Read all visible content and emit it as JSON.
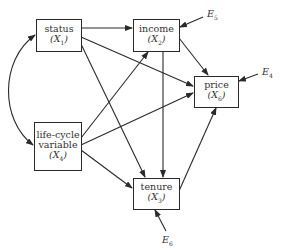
{
  "diagram": {
    "type": "path-diagram",
    "nodes": [
      {
        "id": "status",
        "label": "status",
        "var": "X",
        "sub": "1"
      },
      {
        "id": "income",
        "label": "income",
        "var": "X",
        "sub": "2"
      },
      {
        "id": "price",
        "label": "price",
        "var": "X",
        "sub": "6"
      },
      {
        "id": "lifecycle",
        "label": "life-cycle variable",
        "label_line1": "life-cycle",
        "label_line2": "variable",
        "var": "X",
        "sub": "4"
      },
      {
        "id": "tenure",
        "label": "tenure",
        "var": "X",
        "sub": "3"
      }
    ],
    "errors": [
      {
        "id": "E5",
        "var": "E",
        "sub": "5",
        "target": "income"
      },
      {
        "id": "E4",
        "var": "E",
        "sub": "4",
        "target": "price"
      },
      {
        "id": "E6",
        "var": "E",
        "sub": "6",
        "target": "tenure"
      }
    ],
    "edges": [
      {
        "from": "status",
        "to": "income"
      },
      {
        "from": "status",
        "to": "price"
      },
      {
        "from": "status",
        "to": "tenure"
      },
      {
        "from": "income",
        "to": "price"
      },
      {
        "from": "income",
        "to": "tenure"
      },
      {
        "from": "lifecycle",
        "to": "income"
      },
      {
        "from": "lifecycle",
        "to": "price"
      },
      {
        "from": "lifecycle",
        "to": "tenure"
      },
      {
        "from": "tenure",
        "to": "price"
      },
      {
        "from": "status",
        "to": "lifecycle",
        "type": "curved-bidirectional"
      }
    ],
    "colors": {
      "line": "#2a2a2a",
      "text": "#333333",
      "background": "#ffffff"
    }
  }
}
